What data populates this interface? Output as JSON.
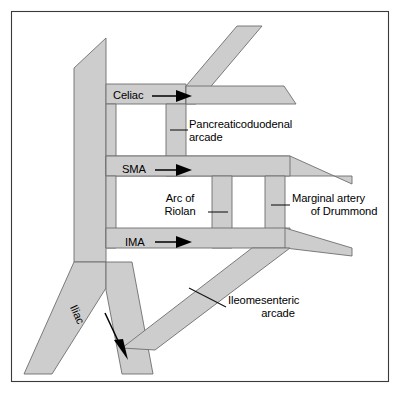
{
  "figure": {
    "type": "anatomical-vessel-diagram",
    "frame": {
      "border_color": "#3a3a3a",
      "background_color": "#ffffff"
    },
    "style": {
      "vessel_fill": "#cdcdcd",
      "vessel_stroke": "#6e6e6e",
      "text_color": "#000000",
      "leader_color": "#111111"
    }
  },
  "labels": {
    "celiac": "Celiac",
    "sma": "SMA",
    "ima": "IMA",
    "iliac": "Iliac",
    "pancreaticoduodenal_arcade": "Pancreaticoduodenal arcade",
    "arc_of_riolan_line1": "Arc of",
    "arc_of_riolan_line2": "Riolan",
    "marginal_artery_line1": "Marginal artery",
    "marginal_artery_line2": "of Drummond",
    "ileomesenteric_line1": "Ileomesenteric",
    "ileomesenteric_line2": "arcade"
  },
  "annotations": [
    {
      "name": "celiac",
      "text": "Celiac",
      "pointer": "arrow-right",
      "target": "celiac-trunk-origin"
    },
    {
      "name": "sma",
      "text": "SMA",
      "pointer": "arrow-right",
      "target": "superior-mesenteric-artery-origin"
    },
    {
      "name": "ima",
      "text": "IMA",
      "pointer": "arrow-right",
      "target": "inferior-mesenteric-artery-origin"
    },
    {
      "name": "iliac",
      "text": "Iliac",
      "pointer": "arrow-diagonal-down",
      "target": "iliac-artery"
    },
    {
      "name": "pancreaticoduodenal-arcade",
      "text": "Pancreaticoduodenal arcade",
      "pointer": "leader-line-left",
      "target": "vertical-connector-upper"
    },
    {
      "name": "arc-of-riolan",
      "text": "Arc of Riolan",
      "pointer": "leader-line-right",
      "target": "vertical-connector-middle-inner"
    },
    {
      "name": "marginal-artery-of-drummond",
      "text": "Marginal artery of Drummond",
      "pointer": "leader-line-left",
      "target": "vertical-connector-middle-outer"
    },
    {
      "name": "ileomesenteric-arcade",
      "text": "Ileomesenteric arcade",
      "pointer": "leader-line-diagonal",
      "target": "ileomesenteric-branch"
    }
  ],
  "vessels": [
    {
      "name": "aorta",
      "orientation": "vertical-descending"
    },
    {
      "name": "celiac-trunk",
      "orientation": "branch-right-and-diagonal-up"
    },
    {
      "name": "superior-mesenteric-artery",
      "orientation": "branch-right-tapering"
    },
    {
      "name": "inferior-mesenteric-artery",
      "orientation": "branch-right-tapering"
    },
    {
      "name": "iliac-artery",
      "orientation": "branch-diagonal-down-right"
    },
    {
      "name": "ileomesenteric-arcade",
      "orientation": "diagonal-down-left"
    },
    {
      "name": "pancreaticoduodenal-arcade",
      "orientation": "vertical-connector"
    },
    {
      "name": "arc-of-riolan",
      "orientation": "vertical-connector"
    },
    {
      "name": "marginal-artery-of-drummond",
      "orientation": "vertical-connector"
    }
  ]
}
